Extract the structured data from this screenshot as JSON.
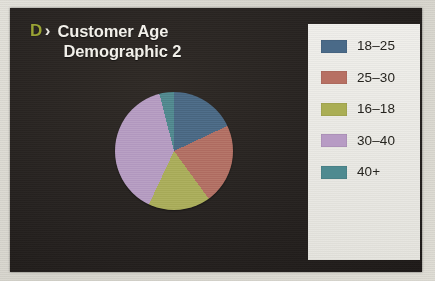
{
  "slide": {
    "logo_letter": "D",
    "logo_chevron": "›",
    "title_line1": "Customer Age",
    "title_line2": "Demographic 2",
    "panel_color": "#262220",
    "logo_color": "#9aa335",
    "title_color": "#f2f0ea",
    "legend_bg": "#eceae5"
  },
  "legend": {
    "items": [
      {
        "label": "18–25",
        "color": "#4a6a88"
      },
      {
        "label": "25–30",
        "color": "#b77063"
      },
      {
        "label": "16–18",
        "color": "#aaae54"
      },
      {
        "label": "30–40",
        "color": "#b79bc4"
      },
      {
        "label": "40+",
        "color": "#4e8a90"
      }
    ]
  },
  "chart_data": {
    "type": "pie",
    "title": "Customer Age Demographic 2",
    "categories": [
      "18–25",
      "25–30",
      "16–18",
      "30–40",
      "40+"
    ],
    "values": [
      18,
      22,
      17,
      39,
      4
    ],
    "unit": "percent",
    "start_angle_deg": 0,
    "direction": "clockwise",
    "colors": [
      "#4a6a88",
      "#b77063",
      "#aaae54",
      "#b79bc4",
      "#4e8a90"
    ],
    "slice_angles_deg": [
      64.8,
      79.2,
      61.2,
      140.4,
      14.4
    ],
    "legend_position": "right",
    "grid": false,
    "xlabel": "",
    "ylabel": ""
  }
}
